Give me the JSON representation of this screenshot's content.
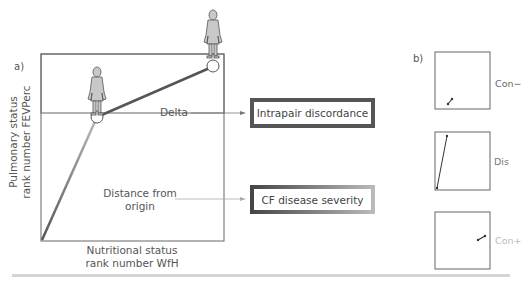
{
  "panel_a": {
    "label": "a)",
    "y_axis_label_line1": "Pulmonary status",
    "y_axis_label_line2": "rank number FEVPerc",
    "x_axis_label_line1": "Nutritional status",
    "x_axis_label_line2": "rank number WfH",
    "delta_label": "Delta",
    "distance_label_line1": "Distance from",
    "distance_label_line2": "origin",
    "box_intrapair": "Intrapair discordance",
    "box_severity": "CF disease severity",
    "icons": [
      "person-silhouette-icon",
      "person-silhouette-icon"
    ]
  },
  "panel_b": {
    "label": "b)",
    "items": [
      {
        "label": "Con−",
        "color": "#666666"
      },
      {
        "label": "Dis",
        "color": "#777777"
      },
      {
        "label": "Con+",
        "color": "#bbbbbb"
      }
    ]
  },
  "colors": {
    "line_dark": "#555555",
    "line_light": "#aaaaaa",
    "figure_fill": "#c8c8c8"
  }
}
